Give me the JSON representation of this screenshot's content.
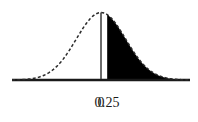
{
  "figure": {
    "title": "",
    "background_color": "#ffffff",
    "curve_color": "#2b2b2b",
    "fill_color": "#000000",
    "axis_color": "#1a1a1a"
  },
  "labels": {
    "mean": "0",
    "cutoff": "0.25"
  },
  "chart_data": {
    "type": "line",
    "title": "",
    "subtitle": "",
    "xlabel": "",
    "ylabel": "",
    "distribution": "standard normal",
    "curve_style": "dashed",
    "grid": false,
    "legend": null,
    "xlim": [
      -3.6,
      3.6
    ],
    "ylim": [
      0,
      0.42
    ],
    "tick_labels": [
      "0",
      "0.25"
    ],
    "tick_values": [
      0,
      0.25
    ],
    "mean_line": {
      "x": 0,
      "style": "solid",
      "label": "0"
    },
    "shaded_region": {
      "from": 0.25,
      "to": 3.6,
      "label": "0.25",
      "fill": "#000000",
      "side": "right-tail"
    },
    "x": [
      -3.6,
      -3.4,
      -3.2,
      -3.0,
      -2.8,
      -2.6,
      -2.4,
      -2.2,
      -2.0,
      -1.8,
      -1.6,
      -1.4,
      -1.2,
      -1.0,
      -0.8,
      -0.6,
      -0.4,
      -0.2,
      0.0,
      0.2,
      0.4,
      0.6,
      0.8,
      1.0,
      1.2,
      1.4,
      1.6,
      1.8,
      2.0,
      2.2,
      2.4,
      2.6,
      2.8,
      3.0,
      3.2,
      3.4,
      3.6
    ],
    "values": [
      0.0006,
      0.0012,
      0.0024,
      0.0044,
      0.0079,
      0.0136,
      0.0224,
      0.0355,
      0.054,
      0.079,
      0.1109,
      0.1497,
      0.1942,
      0.242,
      0.2897,
      0.3332,
      0.3683,
      0.391,
      0.3989,
      0.391,
      0.3683,
      0.3332,
      0.2897,
      0.242,
      0.1942,
      0.1497,
      0.1109,
      0.079,
      0.054,
      0.0355,
      0.0224,
      0.0136,
      0.0079,
      0.0044,
      0.0024,
      0.0012,
      0.0006
    ]
  }
}
